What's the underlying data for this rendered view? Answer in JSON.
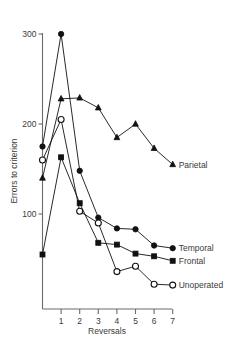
{
  "chart_data": {
    "type": "line",
    "title": "",
    "xlabel": "Reversals",
    "ylabel": "Errors to criterion",
    "x": [
      0,
      1,
      2,
      3,
      4,
      5,
      6,
      7
    ],
    "xticks": [
      1,
      2,
      3,
      4,
      5,
      6,
      7
    ],
    "xtick_labels": [
      "1",
      "2",
      "3",
      "4",
      "5",
      "6",
      "7"
    ],
    "yticks": [
      100,
      200,
      300
    ],
    "ytick_labels": [
      "100",
      "200",
      "300"
    ],
    "xlim": [
      -0.7,
      7.4
    ],
    "ylim": [
      0,
      318
    ],
    "grid": false,
    "legend_position": "right-inline",
    "series": [
      {
        "name": "Parietal",
        "marker": "triangle",
        "fill": "solid",
        "color": "#111111",
        "values": [
          140,
          228,
          229,
          218,
          185,
          200,
          173,
          155
        ]
      },
      {
        "name": "Temporal",
        "marker": "circle",
        "fill": "solid",
        "color": "#111111",
        "values": [
          175,
          300,
          148,
          96,
          84,
          83,
          65,
          62
        ]
      },
      {
        "name": "Frontal",
        "marker": "square",
        "fill": "solid",
        "color": "#111111",
        "values": [
          55,
          163,
          112,
          68,
          66,
          56,
          53,
          48
        ]
      },
      {
        "name": "Unoperated",
        "marker": "circle",
        "fill": "open",
        "color": "#111111",
        "values": [
          160,
          205,
          103,
          90,
          36,
          42,
          22,
          21
        ]
      }
    ]
  },
  "axis": {
    "y_title": "Errors to criterion",
    "x_title": "Reversals"
  },
  "labels": {
    "parietal": "Parietal",
    "temporal": "Temporal",
    "frontal": "Frontal",
    "unoperated": "Unoperated"
  }
}
